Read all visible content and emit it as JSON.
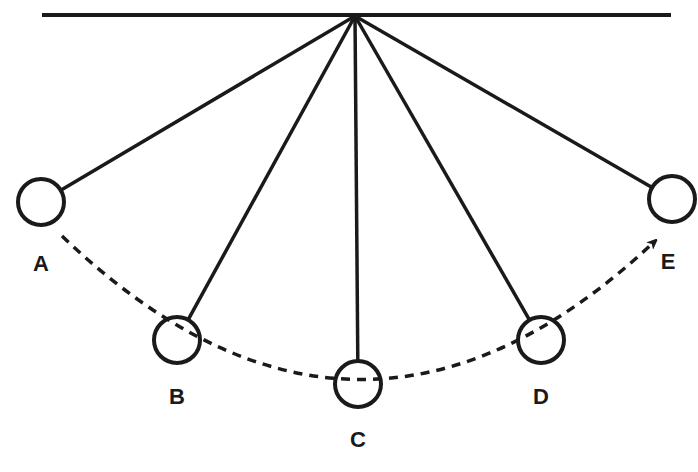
{
  "diagram": {
    "colors": {
      "stroke": "#1a1a1a",
      "background": "#ffffff"
    },
    "ceiling": {
      "x1": 42,
      "y1": 15,
      "x2": 671,
      "y2": 15
    },
    "pivot": {
      "x": 355,
      "y": 16
    },
    "bob_radius": 23,
    "bobs": [
      {
        "id": "A",
        "label": "A",
        "cx": 41,
        "cy": 202,
        "label_x": 41,
        "label_y": 271
      },
      {
        "id": "B",
        "label": "B",
        "cx": 177,
        "cy": 340,
        "label_x": 177,
        "label_y": 404
      },
      {
        "id": "C",
        "label": "C",
        "cx": 358,
        "cy": 384,
        "label_x": 358,
        "label_y": 447
      },
      {
        "id": "D",
        "label": "D",
        "cx": 541,
        "cy": 340,
        "label_x": 541,
        "label_y": 404
      },
      {
        "id": "E",
        "label": "E",
        "cx": 672,
        "cy": 199,
        "label_x": 668,
        "label_y": 269
      }
    ],
    "path": {
      "style": "dashed",
      "direction": "A to E",
      "d": "M 62 236 Q 358 520 654 242",
      "arrowhead": "E"
    }
  }
}
